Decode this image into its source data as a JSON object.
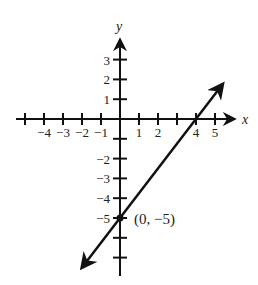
{
  "chart_data": {
    "type": "line",
    "title": "",
    "xlabel": "x",
    "ylabel": "y",
    "xlim": [
      -5.5,
      6
    ],
    "ylim": [
      -8,
      4
    ],
    "grid": false,
    "legend": null,
    "x_ticks": [
      -5,
      -4,
      -3,
      -2,
      -1,
      1,
      2,
      3,
      4,
      5
    ],
    "x_tick_labels": [
      {
        "value": -4,
        "text": "−4"
      },
      {
        "value": -3,
        "text": "−3"
      },
      {
        "value": -2,
        "text": "−2"
      },
      {
        "value": -1,
        "text": "−1"
      },
      {
        "value": 1,
        "text": "1"
      },
      {
        "value": 2,
        "text": "2"
      },
      {
        "value": 4,
        "text": "4"
      },
      {
        "value": 5,
        "text": "5"
      }
    ],
    "y_ticks": [
      3,
      2,
      1,
      -1,
      -2,
      -3,
      -4,
      -5,
      -6,
      -7
    ],
    "y_tick_labels": [
      {
        "value": 3,
        "text": "3"
      },
      {
        "value": 2,
        "text": "2"
      },
      {
        "value": 1,
        "text": "1"
      },
      {
        "value": -2,
        "text": "−2"
      },
      {
        "value": -3,
        "text": "−3"
      },
      {
        "value": -4,
        "text": "−4"
      },
      {
        "value": -5,
        "text": "−5"
      }
    ],
    "series": [
      {
        "name": "line",
        "equation": "y = (5/4)x - 5",
        "slope": 1.25,
        "intercept": -5,
        "x": [
          -2,
          5.4
        ],
        "y": [
          -7.5,
          1.75
        ],
        "arrows": "both"
      }
    ],
    "annotations": [
      {
        "x": 0,
        "y": -5,
        "text": "(0, −5)",
        "marker": "dot"
      }
    ]
  },
  "colors": {
    "ink": "#111111",
    "background": "#ffffff"
  }
}
